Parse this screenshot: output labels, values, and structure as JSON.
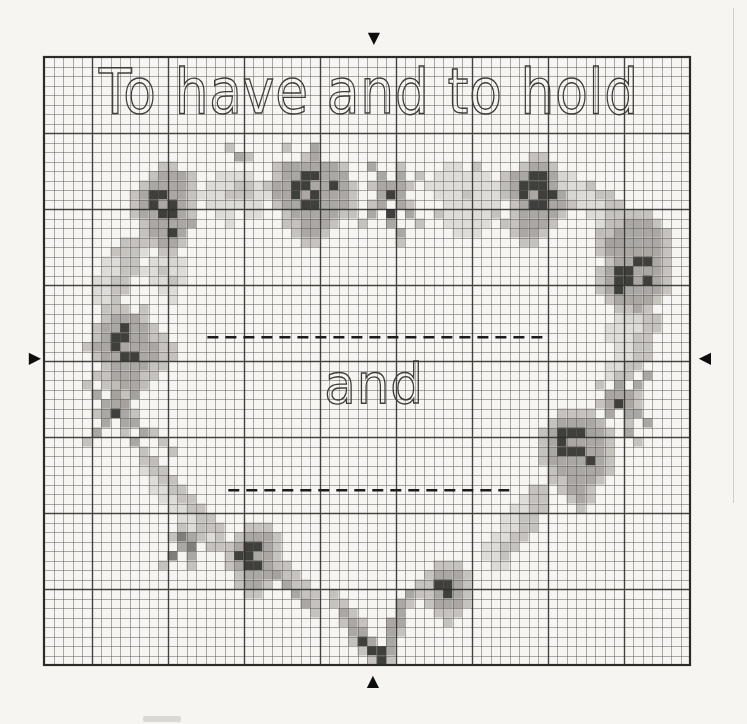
{
  "page": {
    "kind": "scanned cross-stitch chart page",
    "paper_color": "#f6f5f2"
  },
  "chart_data": {
    "type": "heatmap",
    "subtype": "cross-stitch-pattern-grid",
    "title_text": "To have and to hold",
    "center_text": "and",
    "paper_color": "#f6f5f2",
    "dash_color": "#1c1c1c",
    "grid": {
      "cols": 68,
      "rows": 64,
      "cell_px": 9.5,
      "left": 44,
      "top": 57,
      "minor_color": "rgba(92,90,87,0.5)",
      "major_color": "rgba(42,41,39,0.8)",
      "border_color": "#2c2b29",
      "major_cols": [
        5,
        13,
        21,
        29,
        37,
        45,
        53,
        61
      ],
      "major_rows": [
        8,
        16,
        24,
        32,
        40,
        48,
        56
      ]
    },
    "palette": {
      "1": "#dad8d3",
      "2": "#bfbcb7",
      "3": "#a09d99",
      "4": "#6f6d6a",
      "5": "#262522"
    },
    "dashed_lines": [
      {
        "row": 29.5,
        "col_start": 17.2,
        "col_end": 52.8
      },
      {
        "row": 45.6,
        "col_start": 19.4,
        "col_end": 49.6
      }
    ],
    "markers": {
      "top": {
        "glyph": "▼"
      },
      "bottom": {
        "glyph": "▲"
      },
      "left": {
        "glyph": "▶"
      },
      "right": {
        "glyph": "◀"
      }
    },
    "clusters": [
      {
        "name": "tc_stray",
        "col": 19,
        "row": 9,
        "cells": [
          "2..",
          ".32"
        ]
      },
      {
        "name": "tl_rose",
        "col": 8,
        "row": 11,
        "cells": [
          "....22...",
          "...23332.",
          "..233332.",
          ".2355332.",
          ".2353532.",
          ".2335532.",
          "..233333.",
          "..23353..",
          "...2332..",
          "....22...",
          ".....2..."
        ]
      },
      {
        "name": "top_band",
        "col": 16,
        "row": 12,
        "cells": [
          "..1111..",
          ".111221.",
          "11122211",
          ".111111.",
          "..11.11.",
          "...1...."
        ]
      },
      {
        "name": "tc_rose",
        "col": 23,
        "row": 9,
        "cells": [
          "..2..3....",
          "....23....",
          ".23333332.",
          ".23355333.",
          "2335533532",
          ".335353332",
          ".233553332",
          "..23333322",
          "..223332..",
          "...2332...",
          "....22...."
        ]
      },
      {
        "name": "tc_sprig",
        "col": 33,
        "row": 11,
        "cells": [
          ".3..2...",
          "..3.3.2.",
          ".23332..",
          "..353...",
          ".23.32..",
          ".3.5.3..",
          "2..3..2.",
          "....3...",
          "....2..."
        ]
      },
      {
        "name": "tr_pale",
        "col": 40,
        "row": 11,
        "cells": [
          "..11.2...",
          ".111111..",
          "111111112",
          ".11121111",
          "..111111.",
          ".2111112.",
          "..11111..",
          "...111..."
        ]
      },
      {
        "name": "tr_rose",
        "col": 47,
        "row": 10,
        "cells": [
          "....22...",
          "...2332..",
          ".2335532.",
          ".2355533.",
          ".23535532",
          "..2355332",
          "..233332.",
          ".223332..",
          "..2332...",
          "...22...."
        ]
      },
      {
        "name": "r_conn",
        "col": 54,
        "row": 12,
        "cells": [
          "11......",
          "1112....",
          ".11122..",
          "..11122.",
          "...1122.",
          "....112.",
          "....212.",
          ".....22."
        ]
      },
      {
        "name": "r_rose",
        "col": 57,
        "row": 16,
        "cells": [
          "....222...",
          "..223332..",
          ".22333332.",
          ".23333332.",
          ".23333332.",
          "..2335532.",
          ".23553332.",
          ".23553532.",
          ".23533332.",
          "..233332..",
          "...2232...",
          "....22...."
        ]
      },
      {
        "name": "r_side",
        "col": 58,
        "row": 27,
        "cells": [
          "..11122.",
          ".111122.",
          ".11122..",
          "..1122..",
          "..1122..",
          ".1122...",
          ".112....",
          "..2....."
        ]
      },
      {
        "name": "r_sprig",
        "col": 57,
        "row": 33,
        "cells": [
          "...2..3.",
          ".2.3.3..",
          "..3332..",
          ".23532..",
          "..3.33..",
          ".3..2.3.",
          "2...3...",
          ".....2.."
        ]
      },
      {
        "name": "rb_rose",
        "col": 51,
        "row": 37,
        "cells": [
          "...2222...",
          "..233332..",
          ".23555332.",
          ".23533332.",
          ".23555332.",
          ".23333532.",
          "..2333332.",
          "..223332..",
          "...2332...",
          "....232...",
          ".....2...."
        ]
      },
      {
        "name": "r_low",
        "col": 45,
        "row": 45,
        "cells": [
          "......22",
          ".....122",
          "....1122",
          "...1122.",
          "...1122.",
          "..1122..",
          ".1122...",
          ".112....",
          "..11...."
        ]
      },
      {
        "name": "br_flower",
        "col": 39,
        "row": 53,
        "cells": [
          "..222..",
          ".23332.",
          ".25532.",
          ".23532.",
          ".23332.",
          "..222..",
          "...2..."
        ]
      },
      {
        "name": "bottom_v",
        "col": 30,
        "row": 55,
        "cells": [
          ".........2",
          "2.......32",
          "22.....32.",
          ".32....3..",
          ".232..33..",
          "..33..32..",
          "..253.3...",
          "...2553...",
          "....252..."
        ]
      },
      {
        "name": "bl_flower",
        "col": 18,
        "row": 49,
        "cells": [
          "...222..",
          "..23332.",
          ".235532.",
          ".255332.",
          ".235532.",
          "..23332.",
          "..2332..",
          "...22..."
        ]
      },
      {
        "name": "bl_arc1",
        "col": 10,
        "row": 42,
        "cells": [
          "22........",
          "122.......",
          ".122......",
          ".1122.....",
          "..1122....",
          "...1122...",
          "....1122..",
          ".....1122.",
          "......112.",
          ".......22."
        ]
      },
      {
        "name": "bl_leaf",
        "col": 12,
        "row": 49,
        "cells": [
          "..2.2.",
          ".2432.",
          "..34..",
          ".4.3..",
          "2..2.."
        ]
      },
      {
        "name": "bl_arc2",
        "col": 24,
        "row": 53,
        "cells": [
          "22.....",
          "322....",
          ".322...",
          "..322..",
          "...32..",
          "....2.."
        ]
      },
      {
        "name": "l_rose",
        "col": 4,
        "row": 26,
        "cells": [
          "....2.2...",
          "..23332...",
          ".2335332..",
          ".23553322.",
          "2335333322",
          ".233553322",
          "..2333322.",
          ".2233322..",
          "..22332...",
          "...222....",
          "....2....."
        ]
      },
      {
        "name": "l_conn",
        "col": 4,
        "row": 19,
        "cells": [
          "....222.",
          "...2221.",
          "..1122..",
          "..1122..",
          ".1122...",
          ".1122...",
          ".112....",
          "..22...."
        ]
      },
      {
        "name": "l_inner",
        "col": 10,
        "row": 21,
        "cells": [
          ".1111.",
          "11211.",
          ".1121.",
          "..11..",
          "...1.."
        ]
      },
      {
        "name": "l_sprig",
        "col": 4,
        "row": 34,
        "cells": [
          "2..2..2.....",
          ".3.3.3......",
          "..333.......",
          ".23532......",
          "..3.33......",
          ".3..2.32....",
          "2....3..2...",
          "......2..2..",
          ".......2...."
        ]
      }
    ]
  }
}
